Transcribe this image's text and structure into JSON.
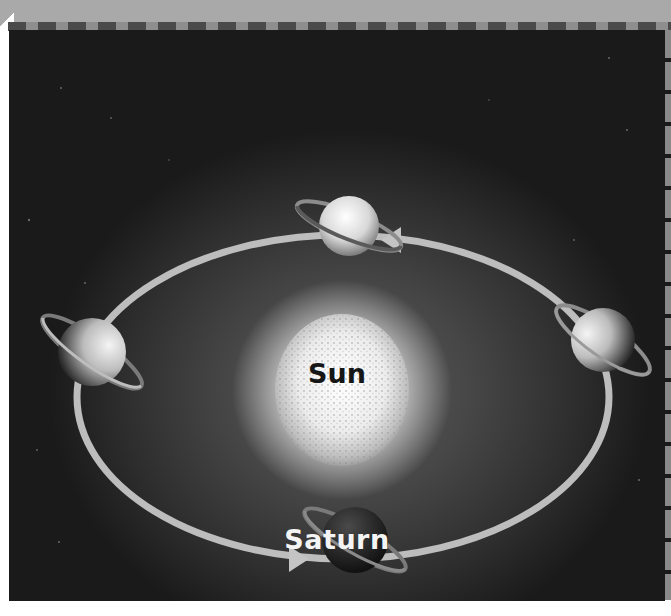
{
  "diagram": {
    "type": "orbit-illustration",
    "colors": {
      "background": "#2e2e2e",
      "orbit": "#bdbdbd",
      "sun": "#efefef",
      "border": "#a9a9a9"
    },
    "labels": {
      "sun": "Sun",
      "planet": "Saturn"
    },
    "orbit": {
      "shape": "ellipse",
      "direction": "counterclockwise",
      "arrows": [
        "top-right pointing left",
        "bottom-left pointing right"
      ]
    },
    "planet_positions": [
      "top",
      "right",
      "bottom",
      "left"
    ],
    "icons": {
      "sun": "sun-icon",
      "planet": "saturn-icon",
      "arrow": "orbit-arrow-icon"
    }
  }
}
